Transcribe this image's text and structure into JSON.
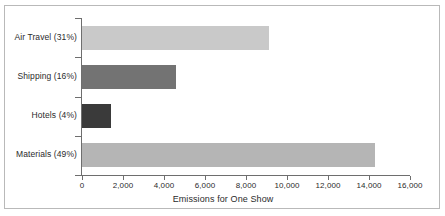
{
  "chart_data": {
    "type": "bar",
    "orientation": "horizontal",
    "title": "",
    "xlabel": "Emissions for One Show",
    "ylabel": "",
    "categories": [
      "Air Travel (31%)",
      "Shipping (16%)",
      "Hotels (4%)",
      "Materials (49%)"
    ],
    "values": [
      9100,
      4600,
      1400,
      14300
    ],
    "xlim": [
      0,
      16000
    ],
    "xticks": [
      0,
      2000,
      4000,
      6000,
      8000,
      10000,
      12000,
      14000,
      16000
    ],
    "xtick_labels": [
      "0",
      "2,000",
      "4,000",
      "6,000",
      "8,000",
      "10,000",
      "12,000",
      "14,000",
      "16,000"
    ],
    "grid": false,
    "legend": "none",
    "bar_colors": [
      "#c9c9c9",
      "#737373",
      "#3a3a3a",
      "#b5b5b5"
    ],
    "axis_color": "#6e6e6e",
    "border_color": "#b9b9b9",
    "background": "#ffffff"
  }
}
